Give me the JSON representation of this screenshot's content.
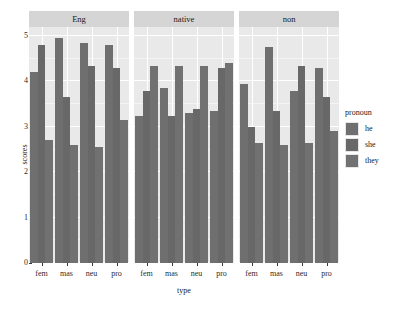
{
  "chart_data": {
    "type": "bar",
    "title": "",
    "xlabel": "type",
    "ylabel": "scores",
    "ylim": [
      0,
      5.2
    ],
    "yticks": [
      0,
      1,
      2,
      3,
      4,
      5
    ],
    "ytick_labels": [
      "0",
      "1",
      "2",
      "3",
      "4",
      "5"
    ],
    "grid": true,
    "legend_position": "right",
    "legend_title": "pronoun",
    "categories": [
      "fem",
      "mas",
      "neu",
      "pro"
    ],
    "facet_variable": "language",
    "facets": [
      "Eng",
      "native",
      "non"
    ],
    "series": [
      {
        "name": "he",
        "color": "#6f6f6f",
        "values_by_facet": {
          "Eng": [
            4.2,
            4.95,
            4.85,
            4.8
          ],
          "native": [
            3.25,
            3.85,
            3.3,
            3.35
          ],
          "non": [
            3.95,
            4.75,
            3.8,
            4.3
          ]
        }
      },
      {
        "name": "she",
        "color": "#686868",
        "values_by_facet": {
          "Eng": [
            4.8,
            3.65,
            4.35,
            4.3
          ],
          "native": [
            3.8,
            3.25,
            3.4,
            4.3
          ],
          "non": [
            3.0,
            3.35,
            4.35,
            3.65
          ]
        }
      },
      {
        "name": "they",
        "color": "#717171",
        "values_by_facet": {
          "Eng": [
            2.7,
            2.6,
            2.55,
            3.15
          ],
          "native": [
            4.35,
            4.35,
            4.35,
            4.4
          ],
          "non": [
            2.65,
            2.6,
            2.65,
            2.9
          ]
        }
      }
    ]
  },
  "legend": {
    "title": "pronoun",
    "items": [
      {
        "label": "he"
      },
      {
        "label": "she"
      },
      {
        "label": "they"
      }
    ]
  },
  "axes": {
    "y_title": "scores",
    "x_title": "type"
  },
  "strips": [
    {
      "label": "Eng"
    },
    {
      "label": "native"
    },
    {
      "label": "non"
    }
  ],
  "x_categories": [
    "fem",
    "mas",
    "neu",
    "pro"
  ],
  "y_tick_labels": [
    "5",
    "4",
    "3",
    "2",
    "1",
    "0"
  ]
}
